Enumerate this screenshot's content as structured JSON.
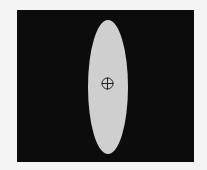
{
  "figure": {
    "background": "#0c0c0c",
    "shape": {
      "type": "ellipse",
      "fill": "#cfcfcf",
      "orientation": "vertical"
    },
    "marker": {
      "type": "crosshair-circle",
      "color": "#222222"
    }
  }
}
